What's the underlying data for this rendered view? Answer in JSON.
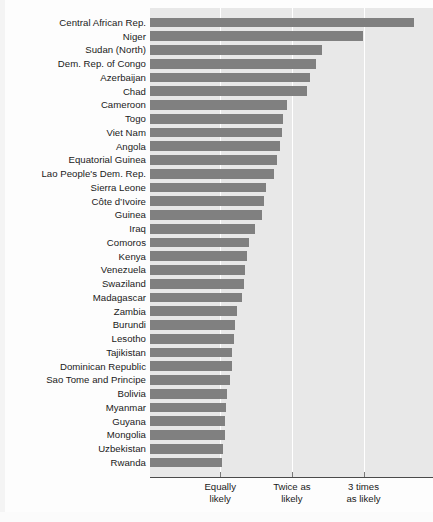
{
  "chart_data": {
    "type": "bar",
    "orientation": "horizontal",
    "title": "",
    "subtitle": "",
    "xlabel": "",
    "ylabel": "",
    "grid": true,
    "legend": null,
    "xlim": [
      0.02,
      3.97
    ],
    "axis_tick_labels": [
      {
        "value": 1,
        "line1": "Equally",
        "line2": "likely"
      },
      {
        "value": 2,
        "line1": "Twice as",
        "line2": "likely"
      },
      {
        "value": 3,
        "line1": "3 times",
        "line2": "as likely"
      }
    ],
    "categories": [
      "Central African Rep.",
      "Niger",
      "Sudan (North)",
      "Dem. Rep. of Congo",
      "Azerbaijan",
      "Chad",
      "Cameroon",
      "Togo",
      "Viet Nam",
      "Angola",
      "Equatorial Guinea",
      "Lao People's Dem. Rep.",
      "Sierra Leone",
      "Côte d’Ivoire",
      "Guinea",
      "Iraq",
      "Comoros",
      "Kenya",
      "Venezuela",
      "Swaziland",
      "Madagascar",
      "Zambia",
      "Burundi",
      "Lesotho",
      "Tajikistan",
      "Dominican Republic",
      "Sao Tome and Principe",
      "Bolivia",
      "Myanmar",
      "Guyana",
      "Mongolia",
      "Uzbekistan",
      "Rwanda"
    ],
    "values": [
      3.7,
      2.99,
      2.42,
      2.33,
      2.25,
      2.21,
      1.93,
      1.88,
      1.86,
      1.84,
      1.79,
      1.75,
      1.64,
      1.61,
      1.59,
      1.49,
      1.4,
      1.37,
      1.35,
      1.33,
      1.31,
      1.23,
      1.21,
      1.19,
      1.17,
      1.16,
      1.14,
      1.1,
      1.08,
      1.07,
      1.06,
      1.04,
      1.02
    ],
    "colors": {
      "bar": "#808080",
      "plot_background": "#e8e8e8",
      "gridline": "#ffffff",
      "axis": "#4a4a4a",
      "text": "#1a1a1a"
    }
  }
}
